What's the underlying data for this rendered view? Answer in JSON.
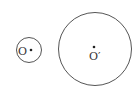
{
  "diagram": {
    "type": "geometry-two-circles",
    "stroke_color": "#555555",
    "circles": [
      {
        "name": "small-circle",
        "cx": 29,
        "cy": 50,
        "r": 12.5,
        "center_label": "O",
        "center_dot": [
          31,
          50
        ],
        "label_pos": [
          18,
          55
        ]
      },
      {
        "name": "large-circle",
        "cx": 95,
        "cy": 49,
        "r": 36.5,
        "center_label": "O′",
        "center_dot": [
          94,
          47
        ],
        "label_pos": [
          89,
          60
        ]
      }
    ]
  }
}
